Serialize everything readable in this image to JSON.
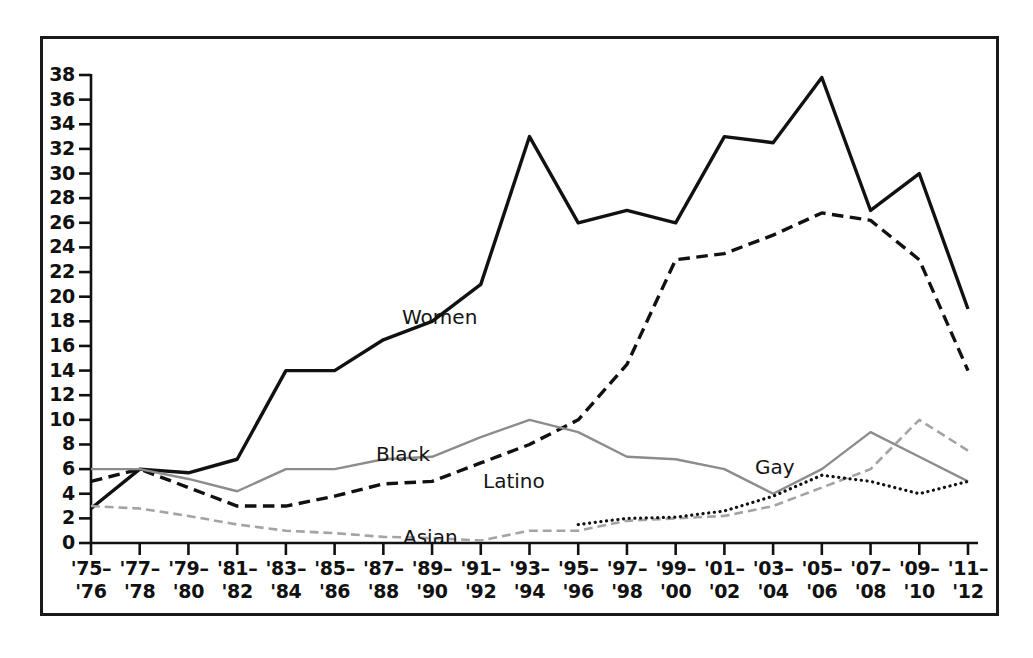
{
  "chart_data": {
    "type": "line",
    "title": "",
    "subtitle": "",
    "xlabel": "",
    "ylabel": "",
    "xlim": [
      0,
      18
    ],
    "ylim": [
      0,
      38
    ],
    "grid": false,
    "legend_position": "inline-labels",
    "y_ticks": [
      0,
      2,
      4,
      6,
      8,
      10,
      12,
      14,
      16,
      18,
      20,
      22,
      24,
      26,
      28,
      30,
      32,
      34,
      36,
      38
    ],
    "categories": [
      "'75–\n'76",
      "'77–\n'78",
      "'79–\n'80",
      "'81–\n'82",
      "'83–\n'84",
      "'85–\n'86",
      "'87–\n'88",
      "'89–\n'90",
      "'91–\n'92",
      "'93–\n'94",
      "'95–\n'96",
      "'97–\n'98",
      "'99–\n'00",
      "'01–\n'02",
      "'03–\n'04",
      "'05–\n'06",
      "'07–\n'08",
      "'09–\n'10",
      "'11–\n'12"
    ],
    "x_tick_labels_top": [
      "'75–",
      "'77–",
      "'79–",
      "'81–",
      "'83–",
      "'85–",
      "'87–",
      "'89–",
      "'91–",
      "'93–",
      "'95–",
      "'97–",
      "'99–",
      "'01–",
      "'03–",
      "'05–",
      "'07–",
      "'09–",
      "'11–"
    ],
    "x_tick_labels_bottom": [
      "'76",
      "'78",
      "'80",
      "'82",
      "'84",
      "'86",
      "'88",
      "'90",
      "'92",
      "'94",
      "'96",
      "'98",
      "'00",
      "'02",
      "'04",
      "'06",
      "'08",
      "'10",
      "'12"
    ],
    "series": [
      {
        "name": "Women",
        "style": "solid",
        "color": "#111111",
        "width": 3.4,
        "label_x": 402,
        "label_y": 305,
        "values": [
          2.8,
          6.0,
          5.7,
          6.8,
          14.0,
          14.0,
          16.5,
          18.0,
          21.0,
          33.0,
          26.0,
          27.0,
          26.0,
          33.0,
          32.5,
          37.8,
          27.0,
          30.0,
          19.0
        ]
      },
      {
        "name": "Latino",
        "style": "dashed",
        "color": "#111111",
        "width": 3.4,
        "label_x": 483,
        "label_y": 469,
        "values": [
          5.0,
          6.0,
          4.5,
          3.0,
          3.0,
          3.8,
          4.8,
          5.0,
          6.5,
          8.0,
          10.0,
          14.5,
          23.0,
          23.5,
          25.0,
          26.8,
          26.2,
          23.0,
          14.0
        ]
      },
      {
        "name": "Black",
        "style": "solid",
        "color": "#8c8c8c",
        "width": 2.4,
        "label_x": 376,
        "label_y": 442,
        "values": [
          6.0,
          6.0,
          5.2,
          4.2,
          6.0,
          6.0,
          6.8,
          7.0,
          8.6,
          10.0,
          9.0,
          7.0,
          6.8,
          6.0,
          4.0,
          6.0,
          9.0,
          7.0,
          5.0
        ]
      },
      {
        "name": "Asian",
        "style": "dashed",
        "color": "#a3a3a3",
        "width": 2.6,
        "label_x": 403,
        "label_y": 525,
        "values": [
          3.0,
          2.8,
          2.2,
          1.5,
          1.0,
          0.8,
          0.5,
          0.4,
          0.2,
          1.0,
          1.0,
          1.8,
          2.0,
          2.2,
          3.0,
          4.5,
          6.0,
          10.0,
          7.5
        ]
      },
      {
        "name": "Gay",
        "style": "dotted",
        "color": "#111111",
        "width": 3.2,
        "label_x": 755,
        "label_y": 455,
        "values": [
          null,
          null,
          null,
          null,
          null,
          null,
          null,
          null,
          null,
          null,
          1.5,
          2.0,
          2.1,
          2.6,
          3.8,
          5.5,
          5.0,
          4.0,
          5.0
        ]
      }
    ]
  }
}
